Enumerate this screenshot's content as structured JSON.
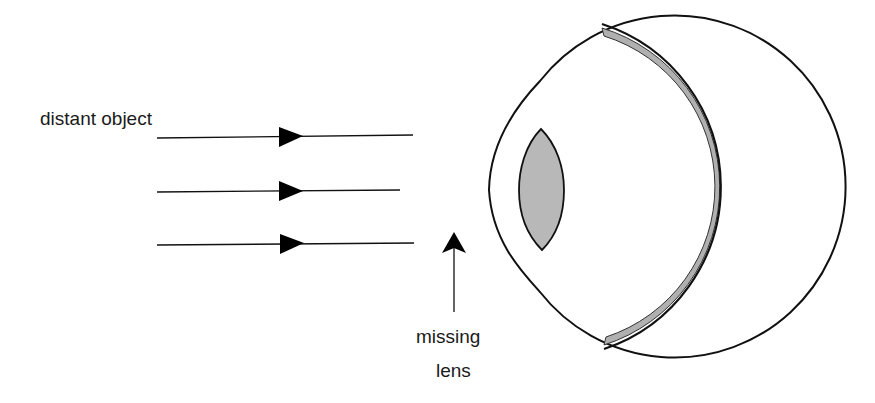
{
  "diagram": {
    "labels": {
      "distant_object": "distant object",
      "missing": "missing",
      "lens": "lens"
    },
    "rays": [
      {
        "x1": 157,
        "y1": 138,
        "x2": 413,
        "y2": 135
      },
      {
        "x1": 157,
        "y1": 192,
        "x2": 400,
        "y2": 190
      },
      {
        "x1": 157,
        "y1": 245,
        "x2": 414,
        "y2": 243
      }
    ],
    "colors": {
      "line": "#111111",
      "lens_fill": "#b8b8b8",
      "retina_fill": "#b0b0b0",
      "background": "#ffffff"
    }
  }
}
